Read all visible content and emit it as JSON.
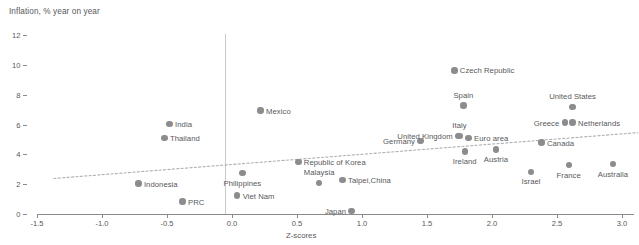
{
  "chart_data": {
    "type": "scatter",
    "title": "Inflation, % year on year",
    "xlabel": "Z-scores",
    "ylabel": "Inflation, % year on year",
    "xlim": [
      -1.5,
      3.0
    ],
    "ylim": [
      0,
      12
    ],
    "xticks": [
      -1.5,
      -1.0,
      -0.5,
      0.0,
      0.5,
      1.0,
      1.5,
      2.0,
      2.5,
      3.0
    ],
    "xtick_labels": [
      "-1.5",
      "-1.0",
      "-0.5",
      "0.0",
      "0.5",
      "1.0",
      "1.5",
      "2.0",
      "2.5",
      "3.0"
    ],
    "yticks": [
      0,
      2,
      4,
      6,
      8,
      10,
      12
    ],
    "ytick_labels": [
      "0",
      "2",
      "4",
      "6",
      "8",
      "10",
      "12"
    ],
    "grid": false,
    "legend": "none",
    "marker_color": "#8c8c8e",
    "trendline": {
      "style": "dotted",
      "color": "#b0b0b2",
      "x_start": -1.37,
      "y_start": 2.45,
      "x_end": 3.12,
      "y_end": 5.52
    },
    "points": [
      {
        "label": "India",
        "x": -0.48,
        "y": 6.1,
        "label_pos": "l"
      },
      {
        "label": "Thailand",
        "x": -0.52,
        "y": 5.15,
        "label_pos": "l"
      },
      {
        "label": "Mexico",
        "x": 0.22,
        "y": 7.0,
        "label_pos": "l"
      },
      {
        "label": "Indonesia",
        "x": -0.72,
        "y": 2.1,
        "label_pos": "l"
      },
      {
        "label": "PRC",
        "x": -0.38,
        "y": 0.9,
        "label_pos": "l"
      },
      {
        "label": "Philippines",
        "x": 0.08,
        "y": 2.8,
        "label_pos": "b"
      },
      {
        "label": "Viet Nam",
        "x": 0.04,
        "y": 1.3,
        "label_pos": "l"
      },
      {
        "label": "Republic of Korea",
        "x": 0.51,
        "y": 3.55,
        "label_pos": "l"
      },
      {
        "label": "Malaysia",
        "x": 0.67,
        "y": 2.15,
        "label_pos": "t"
      },
      {
        "label": "Taipei,China",
        "x": 0.85,
        "y": 2.35,
        "label_pos": "l"
      },
      {
        "label": "Japan",
        "x": 0.92,
        "y": 0.25,
        "label_pos": "r"
      },
      {
        "label": "Germany",
        "x": 1.45,
        "y": 4.95,
        "label_pos": "r"
      },
      {
        "label": "United Kingdom",
        "x": 1.74,
        "y": 5.3,
        "label_pos": "r"
      },
      {
        "label": "Italy",
        "x": 1.75,
        "y": 5.3,
        "label_pos": "t"
      },
      {
        "label": "Euro area",
        "x": 1.82,
        "y": 5.15,
        "label_pos": "l"
      },
      {
        "label": "Ireland",
        "x": 1.79,
        "y": 4.25,
        "label_pos": "b"
      },
      {
        "label": "Austria",
        "x": 2.03,
        "y": 4.4,
        "label_pos": "b"
      },
      {
        "label": "Spain",
        "x": 1.78,
        "y": 7.35,
        "label_pos": "t"
      },
      {
        "label": "Czech Republic",
        "x": 1.71,
        "y": 9.7,
        "label_pos": "l"
      },
      {
        "label": "United States",
        "x": 2.62,
        "y": 7.25,
        "label_pos": "t"
      },
      {
        "label": "Greece",
        "x": 2.56,
        "y": 6.2,
        "label_pos": "r"
      },
      {
        "label": "Netherlands",
        "x": 2.62,
        "y": 6.2,
        "label_pos": "l"
      },
      {
        "label": "Canada",
        "x": 2.38,
        "y": 4.85,
        "label_pos": "l"
      },
      {
        "label": "Israel",
        "x": 2.3,
        "y": 2.9,
        "label_pos": "b"
      },
      {
        "label": "France",
        "x": 2.59,
        "y": 3.35,
        "label_pos": "b"
      },
      {
        "label": "Australia",
        "x": 2.93,
        "y": 3.4,
        "label_pos": "b"
      }
    ]
  }
}
